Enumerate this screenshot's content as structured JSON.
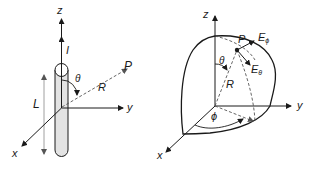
{
  "left_diagram": {
    "title": "Short dipole along z-axis",
    "axes": {
      "z": "z",
      "y": "y",
      "x": "x"
    },
    "current_label": "I",
    "length_label": "L",
    "angle_label": "θ",
    "radius_label": "R",
    "point_label": "P"
  },
  "right_diagram": {
    "title": "Spherical coordinates with field components",
    "axes": {
      "z": "z",
      "y": "y",
      "x": "x"
    },
    "angle_theta_label": "θ",
    "angle_phi_label": "ϕ",
    "radius_label": "R",
    "point_label": "P",
    "e_phi": {
      "base": "E",
      "sub": "ϕ"
    },
    "e_theta": {
      "base": "E",
      "sub": "θ"
    }
  },
  "colors": {
    "line": "#1a1a1a",
    "dashed": "#555555",
    "cylinder_fill": "#e3e3e3"
  }
}
